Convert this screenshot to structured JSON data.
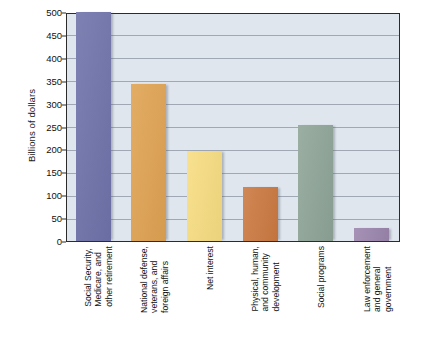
{
  "chart_data": {
    "type": "bar",
    "title": "",
    "xlabel": "",
    "ylabel": "Billions of dollars",
    "ylim": [
      0,
      500
    ],
    "yticks": [
      0,
      50,
      100,
      150,
      200,
      250,
      300,
      350,
      400,
      450,
      500
    ],
    "grid": true,
    "legend": "none",
    "categories": [
      "Social Security, Medicare, and other retirement",
      "National defense, veterans, and foreign affairs",
      "Net interest",
      "Physical, human, and community development",
      "Social programs",
      "Law enforcement and general government"
    ],
    "category_lines": [
      [
        "Social Security,",
        "Medicare, and",
        "other retirement"
      ],
      [
        "National defense,",
        "veterans, and",
        "foreign affairs"
      ],
      [
        "Net interest"
      ],
      [
        "Physical, human,",
        "and community",
        "development"
      ],
      [
        "Social programs"
      ],
      [
        "Law enforcement",
        "and general",
        "government"
      ]
    ],
    "values": [
      500,
      343,
      197,
      117,
      254,
      29
    ],
    "colors": [
      "#6f73aa",
      "#e0a353",
      "#f7dd82",
      "#cc7a41",
      "#8fa598",
      "#9b86ad"
    ]
  },
  "style": {
    "plot_background": "#dfe6ee",
    "gridline_color": "#9fa8b4",
    "frame_color": "#2b2b2b",
    "page_background": "#ffffff",
    "text_color": "#121212"
  }
}
